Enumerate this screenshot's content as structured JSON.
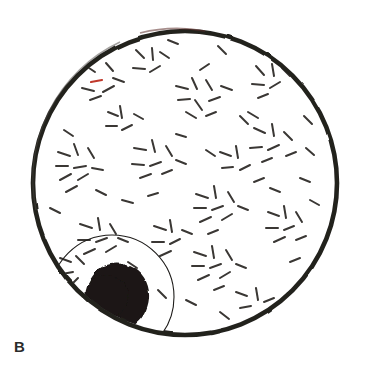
{
  "figure": {
    "panel_label": "B",
    "label_color": "#2b2b2b",
    "background_color": "#ffffff",
    "caption_text": "",
    "type": "micrograph-illustration"
  },
  "dish": {
    "name": "outer-circle",
    "center_x": 185,
    "center_y": 183,
    "radius": 152,
    "stroke_color": "#24221f",
    "stroke_width": 4.6,
    "fill_color": "#ffffff",
    "rim_highlight_color": "#4a4542",
    "rim_tint_color": "#5c2f2c"
  },
  "inner_circle": {
    "name": "inner-circle",
    "center_x": 112,
    "center_y": 297,
    "radius": 62,
    "stroke_color": "#1f1d1b",
    "stroke_width": 1.1,
    "fill_color": "none"
  },
  "dark_mass": {
    "name": "dark-mass",
    "center_x": 119,
    "center_y": 297,
    "width": 62,
    "height": 58,
    "fill_color": "#1a1714",
    "edge_color": "#100e0c"
  },
  "marks": {
    "name": "dash-marks",
    "color": "#3a3734",
    "accent_color": "#c0392b",
    "stroke_width": 2.0,
    "count": 138,
    "length_min": 6,
    "length_max": 15,
    "clusters": [
      {
        "cx": 98,
        "cy": 78,
        "n": 6,
        "spread": 22
      },
      {
        "cx": 146,
        "cy": 62,
        "n": 5,
        "spread": 18
      },
      {
        "cx": 196,
        "cy": 96,
        "n": 9,
        "spread": 26
      },
      {
        "cx": 266,
        "cy": 76,
        "n": 6,
        "spread": 21
      },
      {
        "cx": 268,
        "cy": 140,
        "n": 8,
        "spread": 24
      },
      {
        "cx": 76,
        "cy": 163,
        "n": 9,
        "spread": 25
      },
      {
        "cx": 150,
        "cy": 158,
        "n": 8,
        "spread": 24
      },
      {
        "cx": 214,
        "cy": 205,
        "n": 9,
        "spread": 26
      },
      {
        "cx": 283,
        "cy": 222,
        "n": 7,
        "spread": 22
      },
      {
        "cx": 96,
        "cy": 235,
        "n": 8,
        "spread": 23
      },
      {
        "cx": 166,
        "cy": 236,
        "n": 6,
        "spread": 20
      },
      {
        "cx": 212,
        "cy": 262,
        "n": 9,
        "spread": 25
      },
      {
        "cx": 72,
        "cy": 268,
        "n": 4,
        "spread": 16
      },
      {
        "cx": 248,
        "cy": 300,
        "n": 5,
        "spread": 20
      },
      {
        "cx": 118,
        "cy": 120,
        "n": 5,
        "spread": 19
      },
      {
        "cx": 232,
        "cy": 160,
        "n": 5,
        "spread": 18
      }
    ],
    "accent_mark": {
      "x": 96,
      "y": 81,
      "angle": -10,
      "length": 10
    }
  }
}
